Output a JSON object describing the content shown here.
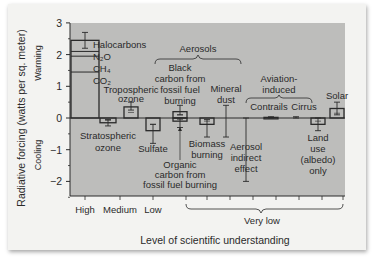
{
  "chart_data": {
    "type": "bar",
    "title": "",
    "ylabel": "Radiative forcing (watts per sq. meter)",
    "ylabel_warming": "Warming",
    "ylabel_cooling": "Cooling",
    "xlabel": "Level of scientific understanding",
    "ylim": [
      -2.5,
      3
    ],
    "yticks": [
      -2,
      -1,
      0,
      1,
      2,
      3
    ],
    "ytick_labels": [
      "−2",
      "−1",
      "0",
      "1",
      "2",
      "3"
    ],
    "understanding_levels": [
      "High",
      "Medium",
      "Low",
      "Very low"
    ],
    "bars": [
      {
        "name": "Long-lived greenhouse gases",
        "value": 2.45,
        "err_low": 2.2,
        "err_high": 2.7,
        "level": "High",
        "stack": [
          {
            "label": "CO2",
            "value": 1.45
          },
          {
            "label": "CH4",
            "value": 0.5
          },
          {
            "label": "N2O",
            "value": 0.15
          },
          {
            "label": "Halocarbons",
            "value": 0.35
          }
        ]
      },
      {
        "name": "Stratospheric ozone",
        "value": -0.15,
        "err_low": -0.25,
        "err_high": -0.05,
        "level": "Medium"
      },
      {
        "name": "Tropospheric ozone",
        "value": 0.35,
        "err_low": 0.25,
        "err_high": 0.5,
        "level": "Medium"
      },
      {
        "name": "Sulfate",
        "value": -0.4,
        "err_low": -0.8,
        "err_high": -0.2,
        "level": "Low"
      },
      {
        "name": "Black carbon from fossil fuel burning",
        "value": 0.2,
        "err_low": 0.1,
        "err_high": 0.4,
        "level": "Very low"
      },
      {
        "name": "Organic carbon from fossil fuel burning",
        "value": -0.1,
        "err_low": -0.3,
        "err_high": 0.0,
        "level": "Very low"
      },
      {
        "name": "Biomass burning",
        "value": -0.2,
        "err_low": -0.6,
        "err_high": -0.05,
        "level": "Very low"
      },
      {
        "name": "Mineral dust",
        "value": 0.0,
        "err_low": -0.6,
        "err_high": 0.4,
        "level": "Very low"
      },
      {
        "name": "Aerosol indirect effect",
        "value": 0.0,
        "err_low": -2.0,
        "err_high": 0.0,
        "level": "Very low"
      },
      {
        "name": "Contrails",
        "value": 0.02,
        "err_low": 0.01,
        "err_high": 0.04,
        "level": "Very low"
      },
      {
        "name": "Cirrus",
        "value": 0.0,
        "err_low": 0.0,
        "err_high": 0.04,
        "level": "Very low"
      },
      {
        "name": "Land use (albedo) only",
        "value": -0.2,
        "err_low": -0.4,
        "err_high": 0.0,
        "level": "Very low"
      },
      {
        "name": "Solar",
        "value": 0.3,
        "err_low": 0.1,
        "err_high": 0.5,
        "level": "Very low"
      }
    ],
    "group_labels": {
      "aerosols": "Aerosols",
      "aviation": "Aviation-induced"
    },
    "grid": false,
    "legend": "none"
  },
  "labels": {
    "halocarbons": "Halocarbons",
    "n2o": "N₂O",
    "ch4": "CH₄",
    "co2": "CO₂",
    "tropo1": "Tropospheric",
    "tropo2": "ozone",
    "strato1": "Stratospheric",
    "strato2": "ozone",
    "aerosols": "Aerosols",
    "bc1": "Black",
    "bc2": "carbon from",
    "bc3": "fossil fuel",
    "bc4": "burning",
    "dust1": "Mineral",
    "dust2": "dust",
    "sulfate": "Sulfate",
    "oc1": "Organic",
    "oc2": "carbon from",
    "oc3": "fossil fuel burning",
    "bio1": "Biomass",
    "bio2": "burning",
    "aie1": "Aerosol",
    "aie2": "indirect",
    "aie3": "effect",
    "avi1": "Aviation-",
    "avi2": "induced",
    "contrails": "Contrails",
    "cirrus": "Cirrus",
    "solar": "Solar",
    "land1": "Land",
    "land2": "use",
    "land3": "(albedo)",
    "land4": "only",
    "high": "High",
    "medium": "Medium",
    "low": "Low",
    "verylow": "Very low"
  },
  "colors": {
    "plot_bg": "#bdbdbb",
    "ink": "#2a2a2a"
  }
}
